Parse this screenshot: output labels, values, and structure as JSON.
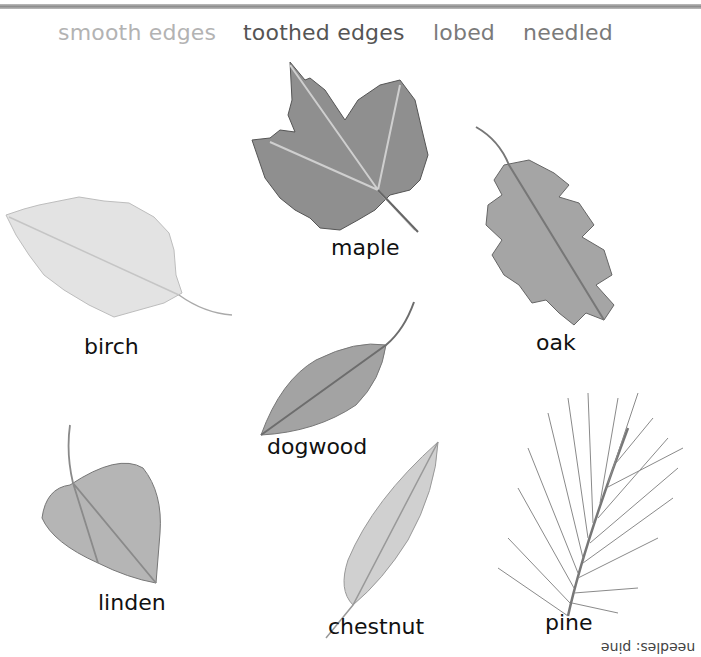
{
  "header": {
    "categories": [
      {
        "label": "smooth edges",
        "color": "#b3b3b3"
      },
      {
        "label": "toothed edges",
        "color": "#555555"
      },
      {
        "label": "lobed",
        "color": "#7a7a7a"
      },
      {
        "label": "needled",
        "color": "#7a7a7a"
      }
    ]
  },
  "leaves": [
    {
      "name": "maple",
      "label": "maple",
      "icon": "maple-leaf-icon"
    },
    {
      "name": "birch",
      "label": "birch",
      "icon": "birch-leaf-icon"
    },
    {
      "name": "oak",
      "label": "oak",
      "icon": "oak-leaf-icon"
    },
    {
      "name": "dogwood",
      "label": "dogwood",
      "icon": "dogwood-leaf-icon"
    },
    {
      "name": "linden",
      "label": "linden",
      "icon": "linden-leaf-icon"
    },
    {
      "name": "chestnut",
      "label": "chestnut",
      "icon": "chestnut-leaf-icon"
    },
    {
      "name": "pine",
      "label": "pine",
      "icon": "pine-needles-icon"
    }
  ],
  "footer": {
    "flipped_note": "needles: pine"
  }
}
